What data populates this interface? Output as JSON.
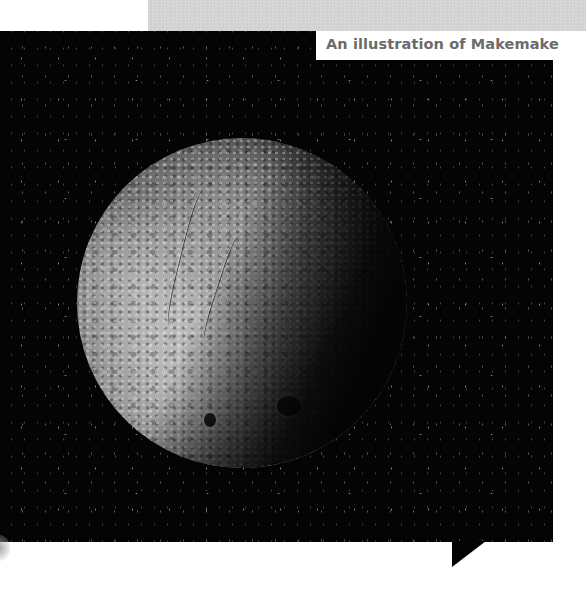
{
  "caption": {
    "text": "An illustration of Makemake"
  },
  "image": {
    "subject": "Makemake (dwarf planet) illustration",
    "description": "Cratered, half-lit dwarf planet against a starfield"
  },
  "colors": {
    "background": "#ffffff",
    "gray_band": "#d4d4d4",
    "photo_bg": "#040404",
    "caption_text": "#6b6b6b"
  }
}
